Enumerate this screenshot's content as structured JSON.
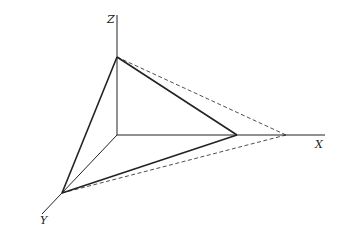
{
  "diagram": {
    "type": "3d-axes-triangle",
    "axes": {
      "x_label": "X",
      "y_label": "Y",
      "z_label": "Z"
    },
    "colors": {
      "stroke": "#222222",
      "background": "#ffffff"
    },
    "points": {
      "origin": [
        117,
        135
      ],
      "z_axis_end": [
        117,
        15
      ],
      "x_axis_end": [
        325,
        135
      ],
      "y_axis_end": [
        42,
        214
      ],
      "z_vertex": [
        117,
        57
      ],
      "x_vertex_solid": [
        237,
        135
      ],
      "x_vertex_dashed": [
        286,
        135
      ],
      "y_vertex": [
        62,
        193
      ]
    }
  }
}
